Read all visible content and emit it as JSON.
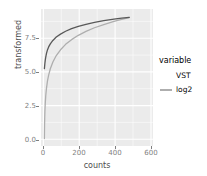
{
  "chart_data": {
    "type": "line",
    "title": "",
    "xlabel": "counts",
    "ylabel": "transformed",
    "xlim": [
      -20,
      640
    ],
    "ylim": [
      -0.55,
      9.6
    ],
    "xticks": [
      0,
      200,
      400,
      600
    ],
    "xtick_labels": [
      "0",
      "200",
      "400",
      "600"
    ],
    "yticks": [
      0.0,
      2.5,
      5.0,
      7.5
    ],
    "ytick_labels": [
      "0.0",
      "2.5",
      "5.0",
      "7.5"
    ],
    "grid": true,
    "grid_color": "#ffffff",
    "panel_background": "#ebebeb",
    "legend_position": "right",
    "legend_title": "variable",
    "x": [
      0,
      1,
      2,
      3,
      5,
      8,
      12,
      18,
      25,
      35,
      50,
      70,
      95,
      125,
      160,
      200,
      245,
      295,
      350,
      410,
      455,
      500
    ],
    "series": [
      {
        "name": "VST",
        "color": "#595959",
        "values": [
          5.18,
          5.31,
          5.45,
          5.58,
          5.79,
          6.04,
          6.29,
          6.57,
          6.79,
          7.02,
          7.27,
          7.52,
          7.74,
          7.95,
          8.14,
          8.31,
          8.46,
          8.61,
          8.74,
          8.85,
          8.92,
          8.98
        ]
      },
      {
        "name": "log2",
        "color": "#aeaeae",
        "values": [
          0.0,
          1.0,
          1.58,
          2.0,
          2.58,
          3.17,
          3.7,
          4.25,
          4.7,
          5.17,
          5.67,
          6.15,
          6.58,
          6.98,
          7.33,
          7.65,
          7.94,
          8.21,
          8.45,
          8.68,
          8.83,
          8.97
        ]
      }
    ],
    "legend_entries": [
      {
        "label": "VST",
        "color": "#595959"
      },
      {
        "label": "log2",
        "color": "#aeaeae"
      }
    ]
  }
}
